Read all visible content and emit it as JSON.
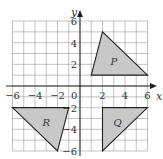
{
  "diagram": {
    "type": "coordinate-grid-transformations",
    "x_axis_label": "x",
    "y_axis_label": "y",
    "x_range": [
      -6,
      6
    ],
    "y_range": [
      -6,
      6
    ],
    "x_tick_labels": [
      "−6",
      "−4",
      "−2",
      "2",
      "4",
      "6"
    ],
    "y_tick_labels": [
      "6",
      "4",
      "2",
      "−2",
      "−4",
      "−6"
    ],
    "origin_label": "0",
    "fill_color": "#c8c8c8",
    "shapes": [
      {
        "label": "P",
        "vertices": [
          [
            1,
            1
          ],
          [
            2,
            5
          ],
          [
            6,
            1
          ]
        ]
      },
      {
        "label": "Q",
        "vertices": [
          [
            2,
            -2
          ],
          [
            6,
            -2
          ],
          [
            2,
            -6
          ]
        ]
      },
      {
        "label": "R",
        "vertices": [
          [
            -6,
            -2
          ],
          [
            -1,
            -2
          ],
          [
            -2,
            -6
          ]
        ]
      }
    ]
  }
}
